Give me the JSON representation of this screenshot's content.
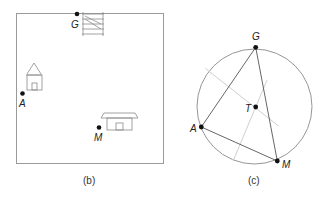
{
  "figures": [
    {
      "id": "b",
      "caption": "(b)",
      "points": [
        {
          "label": "G",
          "x": 76,
          "y": 14
        },
        {
          "label": "A",
          "x": 23,
          "y": 93
        },
        {
          "label": "M",
          "x": 99,
          "y": 127
        }
      ],
      "objects": [
        "map-square",
        "building-near-G",
        "house-near-A",
        "house-near-M"
      ]
    },
    {
      "id": "c",
      "caption": "(c)",
      "points": [
        {
          "label": "G",
          "x": 256,
          "y": 47
        },
        {
          "label": "A",
          "x": 201,
          "y": 127
        },
        {
          "label": "M",
          "x": 277,
          "y": 161
        },
        {
          "label": "T",
          "x": 256,
          "y": 107
        }
      ],
      "circle": {
        "cx": 254,
        "cy": 106,
        "r": 58
      },
      "triangle": [
        "G",
        "A",
        "M"
      ],
      "perpendicular_bisectors": 2
    }
  ],
  "labels": {
    "b_G": "G",
    "b_A": "A",
    "b_M": "M",
    "c_G": "G",
    "c_A": "A",
    "c_M": "M",
    "c_T": "T",
    "cap_b": "(b)",
    "cap_c": "(c)"
  },
  "colors": {
    "stroke": "#8a8a8a",
    "dark": "#111111",
    "bisector": "#c8c8c8"
  }
}
